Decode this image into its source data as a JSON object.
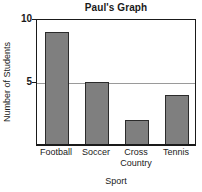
{
  "chart_data": {
    "type": "bar",
    "title": "Paul's Graph",
    "xlabel": "Sport",
    "ylabel": "Number of Students",
    "categories": [
      "Football",
      "Soccer",
      "Cross Country",
      "Tennis"
    ],
    "values": [
      9,
      5,
      2,
      4
    ],
    "ylim": [
      0,
      10
    ],
    "yticks": [
      5,
      10
    ],
    "ytick_labels": [
      "5",
      "10"
    ],
    "grid": true,
    "gridlines_at": [
      5
    ],
    "legend": null,
    "legend_position": "none",
    "bar_color": "#7f7f7f",
    "bar_border_color": "#2b2b2b",
    "axis_color": "#1a1a1a",
    "gridline_color": "#9a9a9a",
    "background_color": "#ffffff",
    "category_labels_wrapped": [
      [
        "Football"
      ],
      [
        "Soccer"
      ],
      [
        "Cross",
        "Country"
      ],
      [
        "Tennis"
      ]
    ]
  }
}
